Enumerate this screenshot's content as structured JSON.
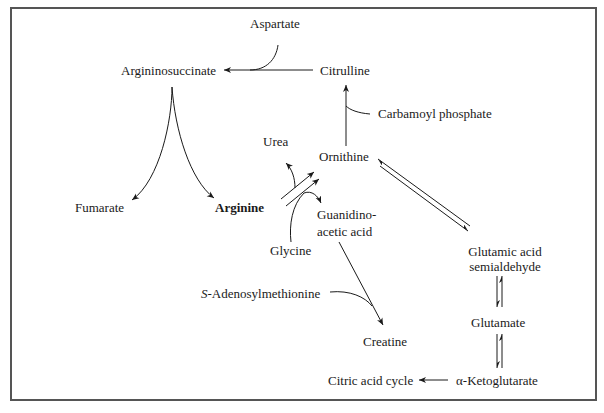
{
  "diagram": {
    "title": "",
    "nodes": {
      "aspartate": "Aspartate",
      "argininosuccinate": "Argininosuccinate",
      "citrulline": "Citrulline",
      "carbamoyl_phosphate": "Carbamoyl phosphate",
      "urea": "Urea",
      "ornithine": "Ornithine",
      "fumarate": "Fumarate",
      "arginine": "Arginine",
      "guanidinoacetic_line1": "Guanidino-",
      "guanidinoacetic_line2": "acetic acid",
      "glycine": "Glycine",
      "glutamic_semialdehyde_line1": "Glutamic acid",
      "glutamic_semialdehyde_line2": "semialdehyde",
      "sam_prefix": "S",
      "sam_rest": "-Adenosylmethionine",
      "creatine": "Creatine",
      "glutamate": "Glutamate",
      "citric_acid_cycle": "Citric acid cycle",
      "alpha_ketoglutarate": "α-Ketoglutarate"
    },
    "edges": [
      {
        "from": "Citrulline",
        "to": "Argininosuccinate",
        "with": "Aspartate"
      },
      {
        "from": "Argininosuccinate",
        "to": "Fumarate"
      },
      {
        "from": "Argininosuccinate",
        "to": "Arginine"
      },
      {
        "from": "Ornithine",
        "to": "Citrulline",
        "with": "Carbamoyl phosphate"
      },
      {
        "from": "Arginine",
        "to": "Ornithine",
        "releases": "Urea"
      },
      {
        "from": "Arginine",
        "to": "Ornithine",
        "with": "Glycine",
        "releases": "Guanidinoacetic acid"
      },
      {
        "from": "Guanidinoacetic acid",
        "to": "Creatine",
        "with": "S-Adenosylmethionine"
      },
      {
        "from": "Ornithine",
        "to": "Glutamic acid semialdehyde",
        "reversible": true
      },
      {
        "from": "Glutamic acid semialdehyde",
        "to": "Glutamate",
        "reversible": true
      },
      {
        "from": "Glutamate",
        "to": "α-Ketoglutarate",
        "reversible": true
      },
      {
        "from": "α-Ketoglutarate",
        "to": "Citric acid cycle"
      }
    ]
  }
}
